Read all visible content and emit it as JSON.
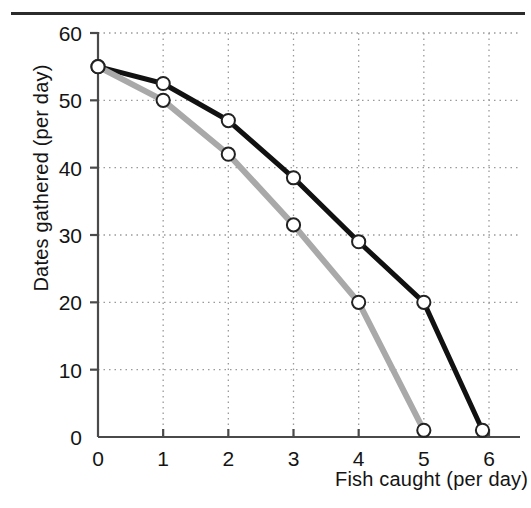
{
  "figure": {
    "background_color": "#ffffff",
    "has_top_rule": true,
    "top_rule_color": "#2b2b2b"
  },
  "chart_data": {
    "type": "line",
    "title": "",
    "subtitle": "",
    "xlabel": "Fish caught (per day)",
    "ylabel": "Dates gathered (per day)",
    "xlim": [
      0,
      6.4
    ],
    "ylim": [
      0,
      60
    ],
    "xticks": [
      0,
      1,
      2,
      3,
      4,
      5,
      6
    ],
    "xtick_labels": [
      "0",
      "1",
      "2",
      "3",
      "4",
      "5",
      "6"
    ],
    "yticks": [
      0,
      10,
      20,
      30,
      40,
      50,
      60
    ],
    "ytick_labels": [
      "0",
      "10",
      "20",
      "30",
      "40",
      "50",
      "60"
    ],
    "grid": true,
    "grid_style": "dotted",
    "grid_color": "#9a9a9a",
    "legend": false,
    "legend_position": "none",
    "marker": "circle-open-white",
    "series": [
      {
        "name": "black-curve",
        "color": "#111111",
        "line_width": 5,
        "x": [
          0,
          1,
          2,
          3,
          4,
          5,
          5.9
        ],
        "values": [
          55,
          52.5,
          47,
          38.5,
          29,
          20,
          1
        ]
      },
      {
        "name": "gray-curve",
        "color": "#a9a9a9",
        "line_width": 6,
        "x": [
          0,
          1,
          2,
          3,
          4,
          5
        ],
        "values": [
          55,
          50,
          42,
          31.5,
          20,
          1
        ]
      }
    ],
    "axis_color": "#4a4a4a",
    "marker_fill": "#ffffff",
    "marker_edge": "#222222"
  }
}
